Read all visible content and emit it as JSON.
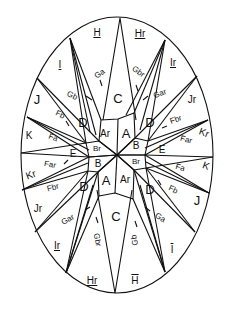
{
  "diagram": {
    "shape": "ellipse",
    "style": "hand-drawn line art, black on white",
    "center_labels": {
      "upper_left_A": "Ar",
      "upper_right_A": "A",
      "upper_left_B": "Br",
      "upper_right_B": "B",
      "lower_left_B": "B",
      "lower_right_B": "Br",
      "lower_left_A": "A",
      "lower_right_A": "Ar"
    },
    "mid_labels": {
      "top_C": "C",
      "bottom_C": "C",
      "upper_left_D": "D",
      "upper_right_D": "D",
      "lower_left_D": "D",
      "lower_right_D": "D",
      "upper_left_E": "E",
      "upper_right_E": "E",
      "lower_left_E": "E",
      "lower_right_E": "E"
    },
    "spike_labels": {
      "top_left_G": "Ga",
      "top_right_G": "Gbr",
      "upper_left_G": "Gb",
      "upper_right_G": "Gar",
      "upper_left_F": "Fb",
      "upper_right_F": "Fbr",
      "left_F_upper": "Fa",
      "right_F_upper": "Far",
      "left_F_lower": "Far",
      "right_F_lower": "Fa",
      "lower_left_F": "Fbr",
      "lower_right_F": "Fb",
      "lower_left_G": "Gar",
      "lower_right_G": "Ga",
      "bottom_left_G": "Gbr",
      "bottom_right_G": "Gb"
    },
    "rim_labels": {
      "top_left": "H",
      "top_right": "Hr",
      "upper_left_I": "I",
      "upper_right_I": "Ir",
      "left_J": "J",
      "right_J": "Jr",
      "left_K": "K",
      "right_K": "Kr",
      "left_Kr": "Kr",
      "right_Kr": "K",
      "lower_left_J": "Jr",
      "lower_right_J": "J",
      "lower_left_I": "Ir",
      "lower_right_I": "I",
      "bottom_left": "Hr",
      "bottom_right": "H"
    }
  }
}
